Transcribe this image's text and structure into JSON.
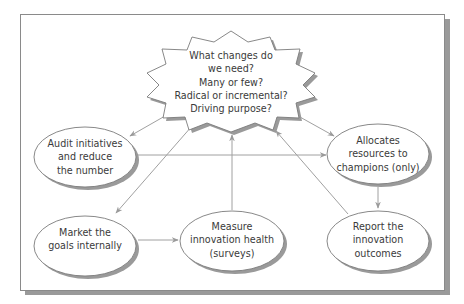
{
  "diagram": {
    "type": "flow",
    "colors": {
      "stroke": "#8c8c8c",
      "arrow": "#9a9a9a",
      "shadow": "#9a9a9a",
      "text": "#3a3a3a",
      "fill": "#ffffff"
    },
    "central": {
      "shape": "starburst",
      "lines": [
        "What changes do",
        "we need?",
        "Many or few?",
        "Radical or incremental?",
        "Driving purpose?"
      ]
    },
    "nodes": [
      {
        "id": "audit",
        "lines": [
          "Audit initiatives",
          "and reduce",
          "the number"
        ]
      },
      {
        "id": "allocates",
        "lines": [
          "Allocates",
          "resources to",
          "champions (only)"
        ]
      },
      {
        "id": "market",
        "lines": [
          "Market the",
          "goals internally"
        ]
      },
      {
        "id": "measure",
        "lines": [
          "Measure",
          "innovation health",
          "(surveys)"
        ]
      },
      {
        "id": "report",
        "lines": [
          "Report the",
          "innovation",
          "outcomes"
        ]
      }
    ],
    "edges": [
      {
        "from": "central",
        "to": "audit"
      },
      {
        "from": "central",
        "to": "allocates"
      },
      {
        "from": "central",
        "to": "market"
      },
      {
        "from": "audit",
        "to": "allocates"
      },
      {
        "from": "market",
        "to": "measure"
      },
      {
        "from": "measure",
        "to": "central"
      },
      {
        "from": "allocates",
        "to": "report"
      },
      {
        "from": "report",
        "to": "central"
      }
    ]
  }
}
